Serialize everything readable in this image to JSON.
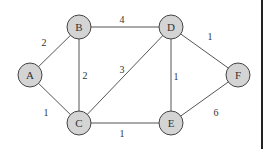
{
  "graph": {
    "nodes": [
      {
        "id": "A",
        "label": "A",
        "x": 30,
        "y": 75
      },
      {
        "id": "B",
        "label": "B",
        "x": 79,
        "y": 27
      },
      {
        "id": "C",
        "label": "C",
        "x": 79,
        "y": 123
      },
      {
        "id": "D",
        "label": "D",
        "x": 171,
        "y": 27
      },
      {
        "id": "E",
        "label": "E",
        "x": 171,
        "y": 123
      },
      {
        "id": "F",
        "label": "F",
        "x": 238,
        "y": 75
      }
    ],
    "edges": [
      {
        "from": "A",
        "to": "B",
        "weight": "2",
        "lx": 44,
        "ly": 42
      },
      {
        "from": "A",
        "to": "C",
        "weight": "1",
        "lx": 46,
        "ly": 112
      },
      {
        "from": "B",
        "to": "C",
        "weight": "2",
        "lx": 85,
        "ly": 75
      },
      {
        "from": "B",
        "to": "D",
        "weight": "4",
        "lx": 122,
        "ly": 19
      },
      {
        "from": "C",
        "to": "D",
        "weight": "3",
        "lx": 122,
        "ly": 69
      },
      {
        "from": "C",
        "to": "E",
        "weight": "1",
        "lx": 122,
        "ly": 133
      },
      {
        "from": "D",
        "to": "E",
        "weight": "1",
        "lx": 176,
        "ly": 76
      },
      {
        "from": "D",
        "to": "F",
        "weight": "1",
        "lx": 210,
        "ly": 36
      },
      {
        "from": "E",
        "to": "F",
        "weight": "6",
        "lx": 216,
        "ly": 112
      }
    ]
  }
}
